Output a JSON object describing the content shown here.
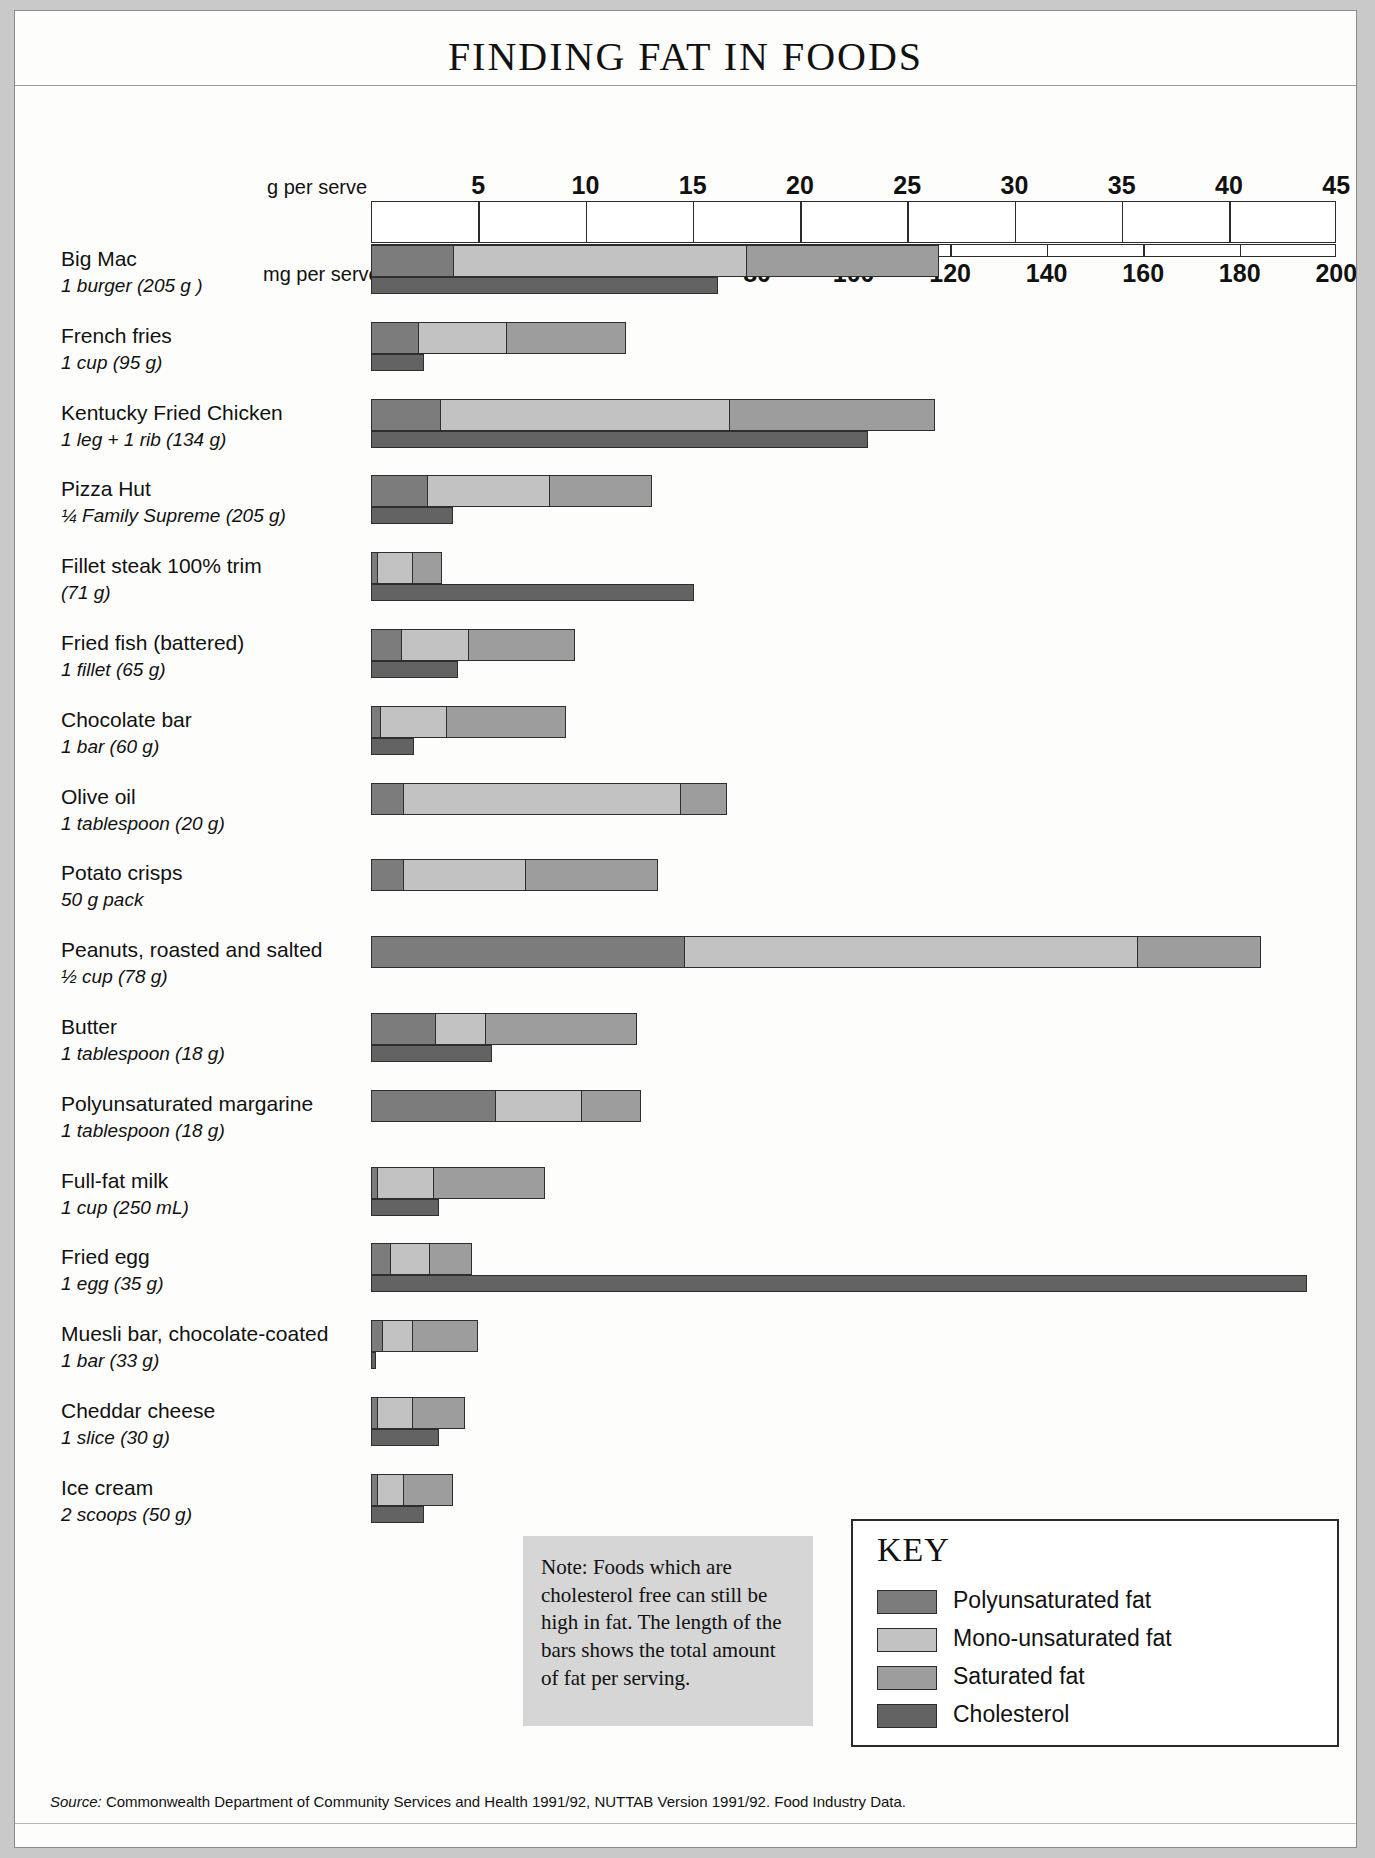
{
  "title": "FINDING FAT IN FOODS",
  "axes": {
    "g_axis_label": "g per serve",
    "mg_axis_label": "mg per serve",
    "g_ticks": [
      5,
      10,
      15,
      20,
      25,
      30,
      35,
      40,
      45
    ],
    "mg_ticks": [
      20,
      40,
      60,
      80,
      100,
      120,
      140,
      160,
      180,
      200
    ],
    "g_max": 45,
    "mg_max": 200
  },
  "colors": {
    "polyunsaturated": "#7c7c7c",
    "mono_unsaturated": "#c2c2c2",
    "saturated": "#9d9d9d",
    "cholesterol": "#636363",
    "page_background": "#fdfdfb",
    "note_background": "#d6d6d6",
    "outline": "#2e2e2e"
  },
  "note": "Note: Foods which are cholesterol free can still be high in fat. The length of the bars shows the total amount of fat per serving.",
  "key": {
    "title": "KEY",
    "items": [
      {
        "label": "Polyunsaturated fat",
        "color": "#7c7c7c"
      },
      {
        "label": "Mono-unsaturated fat",
        "color": "#c2c2c2"
      },
      {
        "label": "Saturated fat",
        "color": "#9d9d9d"
      },
      {
        "label": "Cholesterol",
        "color": "#636363"
      }
    ]
  },
  "source_prefix": "Source:",
  "source": "Commonwealth Department of Community Services and Health 1991/92, NUTTAB Version 1991/92. Food Industry Data.",
  "chart_data": {
    "type": "bar",
    "subtype": "stacked-horizontal",
    "title": "FINDING FAT IN FOODS",
    "xlabel": "g per serve (fat) / mg per serve (cholesterol)",
    "ylabel": "",
    "xlim_g": [
      0,
      45
    ],
    "xlim_mg": [
      0,
      200
    ],
    "grid": true,
    "legend_position": "bottom-right",
    "series": [
      {
        "name": "Polyunsaturated fat",
        "unit": "g"
      },
      {
        "name": "Mono-unsaturated fat",
        "unit": "g"
      },
      {
        "name": "Saturated fat",
        "unit": "g"
      },
      {
        "name": "Cholesterol",
        "unit": "mg"
      }
    ],
    "categories": [
      "Big Mac",
      "French fries",
      "Kentucky Fried Chicken",
      "Pizza Hut",
      "Fillet steak 100% trim",
      "Fried fish (battered)",
      "Chocolate bar",
      "Olive oil",
      "Potato crisps",
      "Peanuts, roasted and salted",
      "Butter",
      "Polyunsaturated margarine",
      "Full-fat milk",
      "Fried egg",
      "Muesli bar, chocolate-coated",
      "Cheddar cheese",
      "Ice cream"
    ],
    "rows": [
      {
        "name": "Big Mac",
        "serving": "1 burger (205 g )",
        "poly": 3.8,
        "mono": 13.7,
        "sat": 9.0,
        "total_fat": 26.5,
        "cholesterol": 72
      },
      {
        "name": "French fries",
        "serving": "1 cup (95 g)",
        "poly": 2.2,
        "mono": 4.1,
        "sat": 5.6,
        "total_fat": 11.9,
        "cholesterol": 11
      },
      {
        "name": "Kentucky Fried Chicken",
        "serving": "1 leg + 1 rib (134 g)",
        "poly": 3.2,
        "mono": 13.5,
        "sat": 9.6,
        "total_fat": 26.3,
        "cholesterol": 103
      },
      {
        "name": "Pizza Hut",
        "serving": "¼ Family Supreme (205 g)",
        "poly": 2.6,
        "mono": 5.7,
        "sat": 4.8,
        "total_fat": 13.1,
        "cholesterol": 17
      },
      {
        "name": "Fillet steak 100% trim",
        "serving": "(71 g)",
        "poly": 0.3,
        "mono": 1.6,
        "sat": 1.4,
        "total_fat": 3.3,
        "cholesterol": 67
      },
      {
        "name": "Fried fish (battered)",
        "serving": "1 fillet (65 g)",
        "poly": 1.4,
        "mono": 3.1,
        "sat": 5.0,
        "total_fat": 9.5,
        "cholesterol": 18
      },
      {
        "name": "Chocolate bar",
        "serving": "1 bar (60 g)",
        "poly": 0.4,
        "mono": 3.1,
        "sat": 5.6,
        "total_fat": 9.1,
        "cholesterol": 9
      },
      {
        "name": "Olive oil",
        "serving": "1 tablespoon (20 g)",
        "poly": 1.5,
        "mono": 12.9,
        "sat": 2.2,
        "total_fat": 16.6,
        "cholesterol": 0
      },
      {
        "name": "Potato crisps",
        "serving": "50 g pack",
        "poly": 1.5,
        "mono": 5.7,
        "sat": 6.2,
        "total_fat": 13.4,
        "cholesterol": 0
      },
      {
        "name": "Peanuts, roasted and salted",
        "serving": "½ cup (78 g)",
        "poly": 14.6,
        "mono": 21.1,
        "sat": 5.8,
        "total_fat": 41.5,
        "cholesterol": 0
      },
      {
        "name": "Butter",
        "serving": "1 tablespoon (18 g)",
        "poly": 3.0,
        "mono": 2.3,
        "sat": 7.1,
        "total_fat": 12.4,
        "cholesterol": 25
      },
      {
        "name": "Polyunsaturated margarine",
        "serving": "1 tablespoon (18 g)",
        "poly": 5.8,
        "mono": 4.0,
        "sat": 2.8,
        "total_fat": 12.6,
        "cholesterol": 0
      },
      {
        "name": "Full-fat milk",
        "serving": "1 cup (250 mL)",
        "poly": 0.3,
        "mono": 2.6,
        "sat": 5.2,
        "total_fat": 8.1,
        "cholesterol": 14
      },
      {
        "name": "Fried egg",
        "serving": "1 egg (35 g)",
        "poly": 0.9,
        "mono": 1.8,
        "sat": 2.0,
        "total_fat": 4.7,
        "cholesterol": 194
      },
      {
        "name": "Muesli bar, chocolate-coated",
        "serving": "1 bar (33 g)",
        "poly": 0.5,
        "mono": 1.4,
        "sat": 3.1,
        "total_fat": 5.0,
        "cholesterol": 1
      },
      {
        "name": "Cheddar cheese",
        "serving": "1 slice (30 g)",
        "poly": 0.3,
        "mono": 1.6,
        "sat": 2.5,
        "total_fat": 4.4,
        "cholesterol": 14
      },
      {
        "name": "Ice cream",
        "serving": "2 scoops (50 g)",
        "poly": 0.3,
        "mono": 1.2,
        "sat": 2.3,
        "total_fat": 3.8,
        "cholesterol": 11
      }
    ]
  }
}
